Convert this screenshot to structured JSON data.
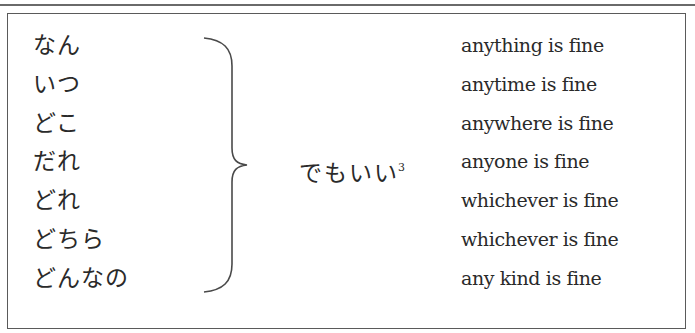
{
  "table": {
    "japanese_words": [
      "なん",
      "いつ",
      "どこ",
      "だれ",
      "どれ",
      "どちら",
      "どんなの"
    ],
    "suffix": "でもいい",
    "footnote_marker": "3",
    "english_translations": [
      "anything is fine",
      "anytime is fine",
      "anywhere is fine",
      "anyone is fine",
      "whichever is fine",
      "whichever is fine",
      "any kind is fine"
    ]
  }
}
